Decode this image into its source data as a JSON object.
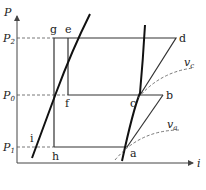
{
  "axes": {
    "y_label": "P",
    "x_label": "i",
    "pressure_levels": [
      {
        "name": "P",
        "sub": "2"
      },
      {
        "name": "P",
        "sub": "0"
      },
      {
        "name": "P",
        "sub": "1"
      }
    ]
  },
  "points": {
    "a": "a",
    "b": "b",
    "c": "c",
    "d": "d",
    "e": "e",
    "f": "f",
    "g": "g",
    "h": "h",
    "i": "i"
  },
  "curves": {
    "vc": {
      "name": "v",
      "sub": "c"
    },
    "va": {
      "name": "v",
      "sub": "a"
    }
  },
  "colors": {
    "line": "#222222",
    "dashed": "#555555",
    "background": "#ffffff"
  }
}
